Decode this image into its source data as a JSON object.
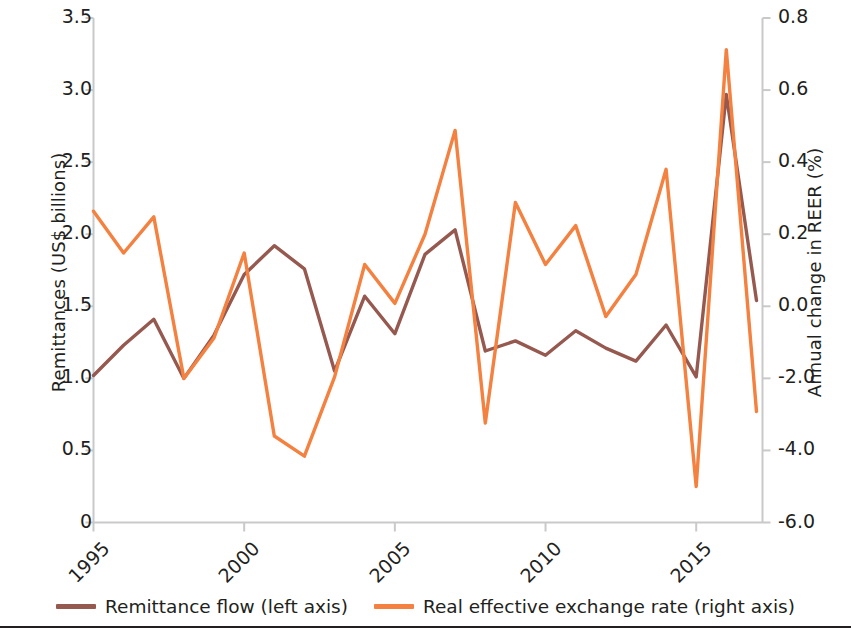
{
  "chart_data": {
    "type": "line",
    "title": "",
    "xlabel": "",
    "ylabel": "Remittances (US$ billions)",
    "y2label": "Annual change in REER (%)",
    "grid": false,
    "legend_position": "bottom-center",
    "xlim": [
      1995,
      2017.2
    ],
    "x_ticks": [
      "1995",
      "2000",
      "2005",
      "2010",
      "2015"
    ],
    "x_tick_values": [
      1995,
      2000,
      2005,
      2010,
      2015
    ],
    "ylim_left": [
      0,
      3.5
    ],
    "y_ticks_left": [
      "0",
      "0.5",
      "1.0",
      "1.5",
      "2.0",
      "2.5",
      "3.0",
      "3.5"
    ],
    "y_tick_values_left": [
      0,
      0.5,
      1.0,
      1.5,
      2.0,
      2.5,
      3.0,
      3.5
    ],
    "y_ticks_right": [
      "-6.0",
      "-4.0",
      "-2.0",
      "0.0",
      "0.2",
      "0.4",
      "0.6",
      "0.8"
    ],
    "y_tick_values_right": [
      -6.0,
      -4.0,
      -2.0,
      0.0,
      0.2,
      0.4,
      0.6,
      0.8
    ],
    "x": [
      1995,
      1996,
      1997,
      1998,
      1999,
      2000,
      2001,
      2002,
      2003,
      2004,
      2005,
      2006,
      2007,
      2008,
      2009,
      2010,
      2011,
      2012,
      2013,
      2014,
      2015,
      2016,
      2017
    ],
    "series": [
      {
        "name": "Remittance flow (left axis)",
        "axis": "left",
        "color": "#96594f",
        "units": "US$ billions",
        "values": [
          1.02,
          1.23,
          1.41,
          1.0,
          1.3,
          1.72,
          1.92,
          1.76,
          1.05,
          1.57,
          1.31,
          1.86,
          2.03,
          1.19,
          1.26,
          1.16,
          1.33,
          1.21,
          1.12,
          1.37,
          1.01,
          2.97,
          1.54
        ]
      },
      {
        "name": "Real effective exchange rate (right axis)",
        "axis": "right",
        "color": "#f4813f",
        "units": "annual change in REER (%) — plotted on an unevenly labelled right axis",
        "values_left_axis_equivalent": [
          2.16,
          1.87,
          2.12,
          1.0,
          1.28,
          1.87,
          0.6,
          0.46,
          1.01,
          1.79,
          1.52,
          2.0,
          2.72,
          0.69,
          2.22,
          1.79,
          2.06,
          1.43,
          1.72,
          2.45,
          0.25,
          3.28,
          0.77
        ],
        "values_right_axis_labelled": [
          0.27,
          0.14,
          0.25,
          -0.65,
          -0.3,
          0.14,
          -1.27,
          -1.5,
          -0.64,
          0.08,
          -0.08,
          0.21,
          0.49,
          -3.55,
          0.3,
          0.08,
          0.17,
          -0.16,
          0.03,
          0.39,
          -5.0,
          0.71,
          -3.01
        ]
      }
    ]
  },
  "legend": {
    "items": [
      {
        "label": "Remittance flow (left axis)",
        "color": "#96594f"
      },
      {
        "label": "Real effective exchange rate (right axis)",
        "color": "#f4813f"
      }
    ]
  },
  "axes": {
    "left_title": "Remittances (US$ billions)",
    "right_title": "Annual change in REER (%)"
  }
}
